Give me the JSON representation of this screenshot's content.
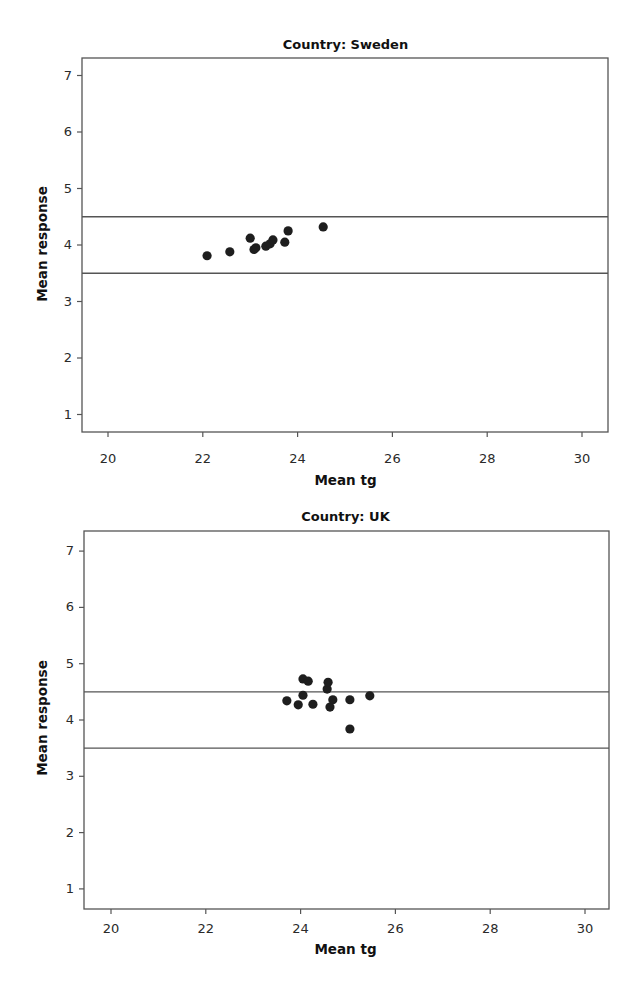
{
  "chart_data": [
    {
      "type": "scatter",
      "title": "Country: Sweden",
      "xlabel": "Mean tg",
      "ylabel": "Mean response",
      "xlim": [
        19.45,
        30.55
      ],
      "ylim": [
        0.7,
        7.35
      ],
      "xticks": [
        20,
        22,
        24,
        26,
        28,
        30
      ],
      "yticks": [
        1,
        2,
        3,
        4,
        5,
        6,
        7
      ],
      "grid": false,
      "legend": null,
      "reference_lines": [
        {
          "orientation": "horizontal",
          "y": 4.5
        },
        {
          "orientation": "horizontal",
          "y": 3.5
        }
      ],
      "series": [
        {
          "name": "Sweden",
          "points": [
            {
              "x": 22.09,
              "y": 3.81
            },
            {
              "x": 22.57,
              "y": 3.88
            },
            {
              "x": 23.0,
              "y": 4.12
            },
            {
              "x": 23.08,
              "y": 3.92
            },
            {
              "x": 23.12,
              "y": 3.95
            },
            {
              "x": 23.33,
              "y": 3.98
            },
            {
              "x": 23.42,
              "y": 4.02
            },
            {
              "x": 23.48,
              "y": 4.09
            },
            {
              "x": 23.73,
              "y": 4.05
            },
            {
              "x": 23.8,
              "y": 4.25
            },
            {
              "x": 24.54,
              "y": 4.32
            }
          ]
        }
      ]
    },
    {
      "type": "scatter",
      "title": "Country: UK",
      "xlabel": "Mean tg",
      "ylabel": "Mean response",
      "xlim": [
        19.45,
        30.55
      ],
      "ylim": [
        0.65,
        7.35
      ],
      "xticks": [
        20,
        22,
        24,
        26,
        28,
        30
      ],
      "yticks": [
        1,
        2,
        3,
        4,
        5,
        6,
        7
      ],
      "grid": false,
      "legend": null,
      "reference_lines": [
        {
          "orientation": "horizontal",
          "y": 4.5
        },
        {
          "orientation": "horizontal",
          "y": 3.5
        }
      ],
      "series": [
        {
          "name": "UK",
          "points": [
            {
              "x": 23.71,
              "y": 4.34
            },
            {
              "x": 23.95,
              "y": 4.27
            },
            {
              "x": 24.05,
              "y": 4.44
            },
            {
              "x": 24.05,
              "y": 4.73
            },
            {
              "x": 24.16,
              "y": 4.69
            },
            {
              "x": 24.26,
              "y": 4.28
            },
            {
              "x": 24.56,
              "y": 4.55
            },
            {
              "x": 24.58,
              "y": 4.67
            },
            {
              "x": 24.62,
              "y": 4.23
            },
            {
              "x": 24.68,
              "y": 4.36
            },
            {
              "x": 25.04,
              "y": 4.36
            },
            {
              "x": 25.04,
              "y": 3.84
            },
            {
              "x": 25.46,
              "y": 4.43
            }
          ]
        }
      ]
    }
  ],
  "panels": {
    "sweden": {
      "title": "Country: Sweden",
      "xlabel": "Mean tg",
      "ylabel": "Mean response"
    },
    "uk": {
      "title": "Country: UK",
      "xlabel": "Mean tg",
      "ylabel": "Mean response"
    }
  },
  "style": {
    "frame_color": "#555555",
    "point_color": "#1e1e1e",
    "reference_line_color": "#555555"
  }
}
